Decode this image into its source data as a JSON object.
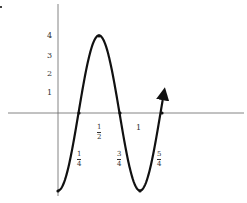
{
  "chart_data": {
    "type": "line",
    "title": "",
    "xlabel": "",
    "ylabel": "",
    "function_description": "y = -4cos(2πx)",
    "x": [
      0,
      0.25,
      0.5,
      0.75,
      1,
      1.25
    ],
    "values": [
      -4,
      0,
      4,
      0,
      -4,
      0
    ],
    "y_tick_labels": [
      "1",
      "2",
      "3",
      "4"
    ],
    "x_tick_labels": [
      {
        "num": "1",
        "den": "4",
        "value": 0.25
      },
      {
        "num": "1",
        "den": "2",
        "value": 0.5
      },
      {
        "num": "3",
        "den": "4",
        "value": 0.75
      },
      {
        "label": "1",
        "value": 1
      },
      {
        "num": "5",
        "den": "4",
        "value": 1.25
      }
    ],
    "ylim": [
      -4,
      5.3
    ],
    "xlim": [
      -0.6,
      2.3
    ],
    "grid": false,
    "legend": null,
    "curve_ends_with_arrow": true,
    "curve_color": "#111111",
    "axis_color": "#555555"
  }
}
